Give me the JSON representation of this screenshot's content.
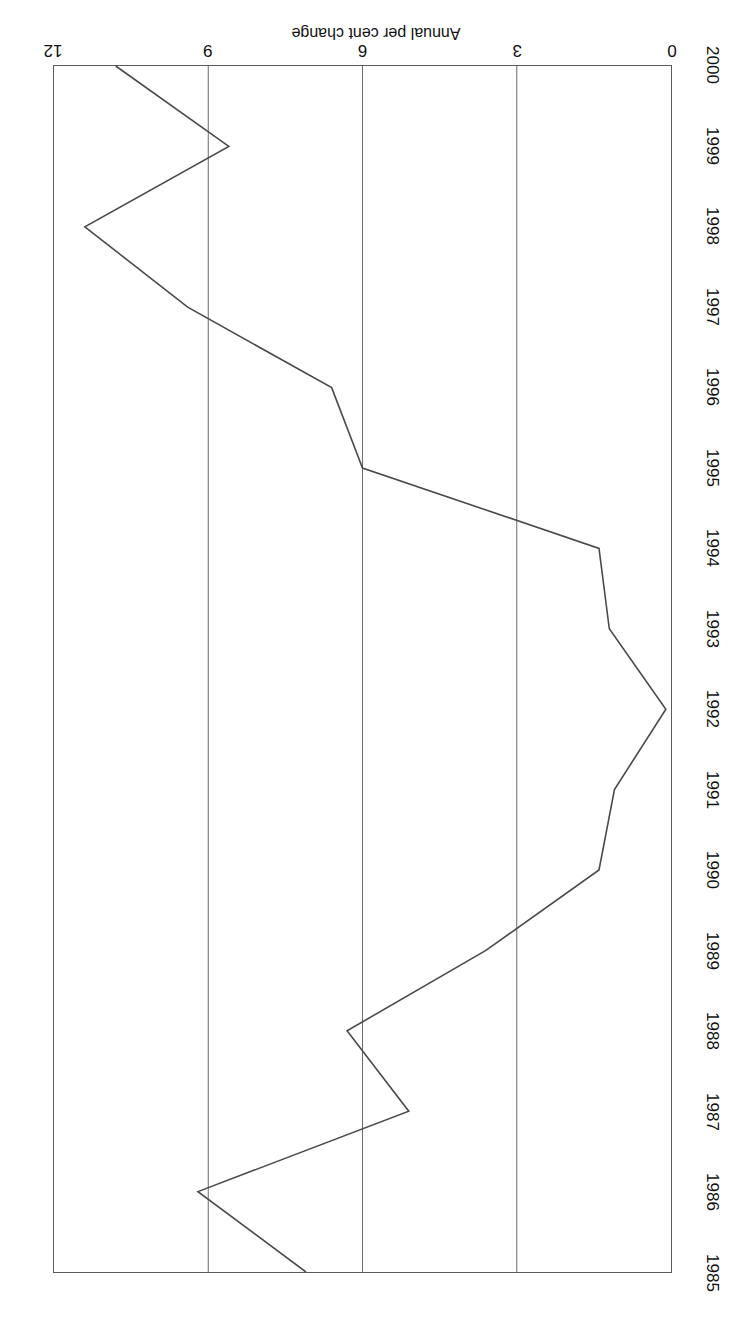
{
  "figure": {
    "orientation": "rotated-180",
    "background_color": "#ffffff",
    "line_color": "#4a4a4a",
    "frame_color": "#5a5a5a",
    "grid_color": "#6a6a6a"
  },
  "axis_title": "Annual per cent change",
  "chart_data": {
    "type": "line",
    "title": "",
    "subtitle": "",
    "xlabel": "",
    "ylabel": "Annual per cent change",
    "orientation": "rotated-180",
    "grid": "value-axis gridlines only",
    "legend": "none",
    "categories": [
      "1985",
      "1986",
      "1987",
      "1988",
      "1989",
      "1990",
      "1991",
      "1992",
      "1993",
      "1994",
      "1995",
      "1996",
      "1997",
      "1998",
      "1999",
      "2000"
    ],
    "x": [
      1985,
      1986,
      1987,
      1988,
      1989,
      1990,
      1991,
      1992,
      1993,
      1994,
      1995,
      1996,
      1997,
      1998,
      1999,
      2000
    ],
    "values": [
      7.1,
      9.2,
      5.1,
      6.3,
      3.6,
      1.4,
      1.1,
      0.1,
      1.2,
      1.4,
      6.0,
      6.6,
      9.4,
      11.4,
      8.6,
      10.8
    ],
    "series": [
      {
        "name": "Annual per cent change",
        "values": [
          7.1,
          9.2,
          5.1,
          6.3,
          3.6,
          1.4,
          1.1,
          0.1,
          1.2,
          1.4,
          6.0,
          6.6,
          9.4,
          11.4,
          8.6,
          10.8
        ]
      }
    ],
    "ylim": [
      0,
      12
    ],
    "yticks": [
      0,
      3,
      6,
      9,
      12
    ],
    "ytick_labels": [
      "0",
      "3",
      "6",
      "9",
      "12"
    ],
    "xlim": [
      1985,
      2000
    ],
    "xtick_labels": [
      "1985",
      "1986",
      "1987",
      "1988",
      "1989",
      "1990",
      "1991",
      "1992",
      "1993",
      "1994",
      "1995",
      "1996",
      "1997",
      "1998",
      "1999",
      "2000"
    ]
  }
}
